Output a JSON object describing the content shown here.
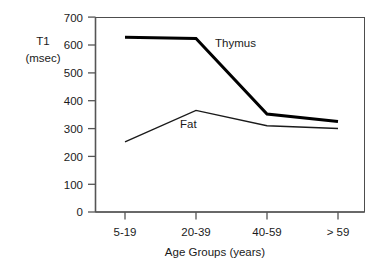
{
  "chart_data": {
    "type": "line",
    "title": "",
    "xlabel": "Age Groups (years)",
    "ylabel": "T1 (msec)",
    "ylabel_line1": "T1",
    "ylabel_line2": "(msec)",
    "categories": [
      "5-19",
      "20-39",
      "40-59",
      "> 59"
    ],
    "ylim": [
      0,
      700
    ],
    "yticks": [
      0,
      100,
      200,
      300,
      400,
      500,
      600,
      700
    ],
    "ytick_labels": [
      "0",
      "100",
      "200",
      "300",
      "400",
      "500",
      "600",
      "700"
    ],
    "grid": false,
    "legend_position": "inline-annotations",
    "series": [
      {
        "name": "Thymus",
        "label": "Thymus",
        "values": [
          628,
          623,
          352,
          325
        ],
        "color": "#000000",
        "line_width": 3
      },
      {
        "name": "Fat",
        "label": "Fat",
        "values": [
          252,
          365,
          310,
          300
        ],
        "color": "#1a1a1a",
        "line_width": 1.4
      }
    ],
    "annotations": [
      {
        "text": "Thymus",
        "x_value": "20-39",
        "y_value": 640
      },
      {
        "text": "Fat",
        "x_value": "20-39",
        "y_value": 340
      }
    ]
  },
  "axes": {
    "y_axis_name": "t1-axis",
    "x_axis_name": "age-groups-axis"
  }
}
